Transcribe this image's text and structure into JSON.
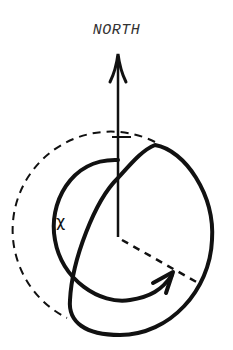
{
  "diagram": {
    "direction_label": "NORTH",
    "angle_label": "χ",
    "colors": {
      "stroke": "#111111",
      "label": "#333333",
      "background": "#ffffff"
    },
    "elements": [
      "north-arrow",
      "dashed-reference-circle",
      "angle-arc-with-arrow",
      "tilted-orbit-loop",
      "dashed-radius-line"
    ]
  }
}
